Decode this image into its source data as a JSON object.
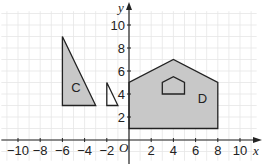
{
  "diagram": {
    "type": "coordinate-grid",
    "axes": {
      "x_label": "x",
      "y_label": "y",
      "origin_label": "O",
      "x_range": [
        -11,
        11
      ],
      "y_range": [
        -1,
        11
      ],
      "x_ticks": [
        "−10",
        "−8",
        "−6",
        "−4",
        "−2",
        "2",
        "4",
        "6",
        "8",
        "10"
      ],
      "x_tick_values": [
        -10,
        -8,
        -6,
        -4,
        -2,
        2,
        4,
        6,
        8,
        10
      ],
      "y_ticks": [
        "2",
        "4",
        "6",
        "8",
        "10"
      ],
      "y_tick_values": [
        2,
        4,
        6,
        8,
        10
      ]
    },
    "shapes": [
      {
        "name": "C",
        "label": "C",
        "fill": "#c8c8c8",
        "points": [
          [
            -6,
            3
          ],
          [
            -6,
            9
          ],
          [
            -3,
            3
          ]
        ],
        "label_pos": [
          -5.2,
          4.2
        ]
      },
      {
        "name": "small-triangle",
        "label": "",
        "fill": "none",
        "points": [
          [
            -2,
            3
          ],
          [
            -2,
            5
          ],
          [
            -1,
            3
          ]
        ]
      },
      {
        "name": "D",
        "label": "D",
        "fill": "#c8c8c8",
        "points": [
          [
            0,
            1
          ],
          [
            0,
            5
          ],
          [
            4,
            7
          ],
          [
            8,
            5
          ],
          [
            8,
            1
          ]
        ],
        "label_pos": [
          6.2,
          3.2
        ]
      },
      {
        "name": "small-pentagon",
        "label": "",
        "fill": "none",
        "points": [
          [
            3,
            4
          ],
          [
            3,
            5
          ],
          [
            4,
            5.5
          ],
          [
            5,
            5
          ],
          [
            5,
            4
          ]
        ]
      }
    ]
  }
}
